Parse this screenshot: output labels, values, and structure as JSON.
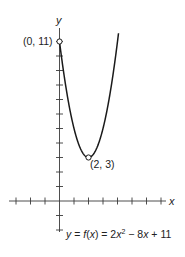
{
  "chart_data": {
    "type": "line",
    "title": "",
    "function": "y = f(x) = 2x^2 - 8x + 11",
    "xlabel": "x",
    "ylabel": "y",
    "xlim": [
      -3,
      7
    ],
    "ylim": [
      -2,
      11
    ],
    "grid": false,
    "x_ticks": [
      -3,
      -2,
      -1,
      1,
      2,
      3,
      4,
      5,
      6,
      7
    ],
    "y_ticks": [
      -2,
      -1,
      1,
      2,
      3,
      4,
      5,
      6,
      7,
      8,
      9,
      10,
      11
    ],
    "series": [
      {
        "name": "f(x) = 2x^2 - 8x + 11",
        "x": [
          0,
          0.5,
          1,
          1.5,
          2,
          2.5,
          3,
          3.5,
          4
        ],
        "y": [
          11,
          7.5,
          5,
          3.5,
          3,
          3.5,
          5,
          7.5,
          11
        ]
      }
    ],
    "annotations": [
      {
        "point": [
          0,
          11
        ],
        "label": "(0, 11)",
        "marker": "open-circle"
      },
      {
        "point": [
          2,
          3
        ],
        "label": "(2, 3)",
        "marker": "open-circle"
      }
    ]
  },
  "labels": {
    "y_axis": "y",
    "x_axis": "x",
    "y_intercept": "(0, 11)",
    "vertex": "(2, 3)",
    "equation": {
      "lhs_y": "y",
      "eq1": " = ",
      "f": "f",
      "paren_open": "(",
      "x1": "x",
      "paren_close": ")",
      "eq2": " = 2",
      "x2": "x",
      "exp": "2",
      "minus": " − 8",
      "x3": "x",
      "plus": " + 11"
    }
  },
  "colors": {
    "curve": "#1a1a1a",
    "axis": "#3a3a3a",
    "text": "#222222",
    "background": "#ffffff"
  }
}
